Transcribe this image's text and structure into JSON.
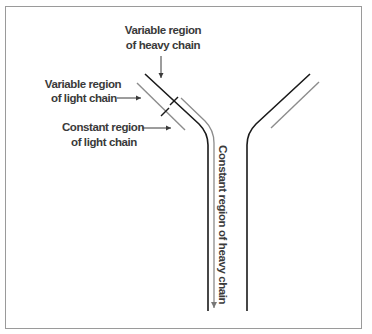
{
  "diagram": {
    "type": "antibody-structure",
    "labels": {
      "heavy_variable": [
        "Variable region",
        "of heavy chain"
      ],
      "light_variable": [
        "Variable region",
        "of light chain"
      ],
      "light_constant": [
        "Constant region",
        "of light chain"
      ],
      "heavy_constant": "Constant region of heavy chain"
    },
    "colors": {
      "heavy_chain": "#1a1a1a",
      "light_chain": "#8c8c8c",
      "text": "#3a3a3a",
      "border": "#9a9a9a"
    }
  }
}
